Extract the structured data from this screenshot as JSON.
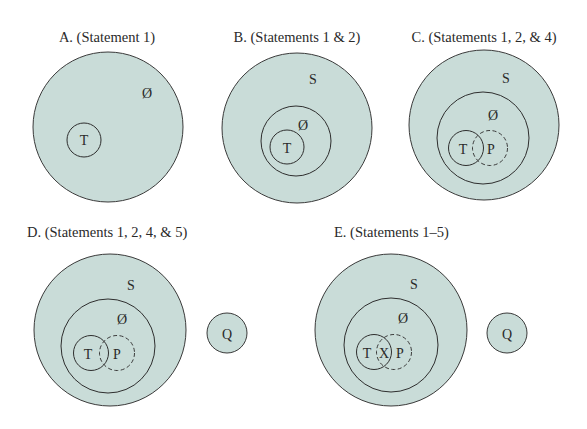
{
  "figure": {
    "colors": {
      "set_fill": "#c9dcd8",
      "stroke": "#2e2e2e",
      "background": "#ffffff"
    },
    "panels": [
      {
        "id": "A",
        "title": "A. (Statement 1)",
        "circles": [
          {
            "label": "",
            "role": "universe",
            "cx": 108,
            "cy": 127,
            "r": 75
          },
          {
            "label": "T",
            "cx": 84,
            "cy": 140,
            "r": 17
          }
        ],
        "labels": [
          {
            "text": "Ø",
            "x": 147,
            "y": 98
          },
          {
            "text": "T",
            "x": 84,
            "y": 145
          }
        ]
      },
      {
        "id": "B",
        "title": "B. (Statements 1 & 2)",
        "circles": [
          {
            "label": "S",
            "role": "universe",
            "cx": 297,
            "cy": 128,
            "r": 75
          },
          {
            "label": "Ø",
            "cx": 296,
            "cy": 141,
            "r": 35
          },
          {
            "label": "T",
            "cx": 287,
            "cy": 147,
            "r": 17
          }
        ],
        "labels": [
          {
            "text": "S",
            "x": 313,
            "y": 84
          },
          {
            "text": "Ø",
            "x": 303,
            "y": 130
          },
          {
            "text": "T",
            "x": 287,
            "y": 153
          }
        ]
      },
      {
        "id": "C",
        "title": "C. (Statements 1, 2, & 4)",
        "circles": [
          {
            "label": "S",
            "role": "universe",
            "cx": 484,
            "cy": 125,
            "r": 75
          },
          {
            "label": "Ø",
            "cx": 483,
            "cy": 138,
            "r": 46
          },
          {
            "label": "T",
            "cx": 466,
            "cy": 148,
            "r": 17.5
          },
          {
            "label": "P",
            "cx": 490,
            "cy": 148,
            "r": 17.5,
            "dashed": true
          }
        ],
        "labels": [
          {
            "text": "S",
            "x": 506,
            "y": 83
          },
          {
            "text": "Ø",
            "x": 493,
            "y": 120
          },
          {
            "text": "T",
            "x": 463,
            "y": 154
          },
          {
            "text": "P",
            "x": 491,
            "y": 154
          }
        ]
      },
      {
        "id": "D",
        "title": "D. (Statements 1, 2, 4, & 5)",
        "circles": [
          {
            "label": "S",
            "role": "universe",
            "cx": 110,
            "cy": 330,
            "r": 76
          },
          {
            "label": "Ø",
            "cx": 108,
            "cy": 346,
            "r": 47
          },
          {
            "label": "T",
            "cx": 91,
            "cy": 353,
            "r": 17.5
          },
          {
            "label": "P",
            "cx": 117,
            "cy": 353,
            "r": 17.5,
            "dashed": true
          },
          {
            "label": "Q",
            "cx": 227,
            "cy": 333,
            "r": 20
          }
        ],
        "labels": [
          {
            "text": "S",
            "x": 131,
            "y": 290
          },
          {
            "text": "Ø",
            "x": 122,
            "y": 324
          },
          {
            "text": "T",
            "x": 88,
            "y": 359
          },
          {
            "text": "P",
            "x": 117,
            "y": 359
          },
          {
            "text": "Q",
            "x": 227,
            "y": 339
          }
        ]
      },
      {
        "id": "E",
        "title": "E. (Statements 1–5)",
        "circles": [
          {
            "label": "S",
            "role": "universe",
            "cx": 391,
            "cy": 330,
            "r": 76
          },
          {
            "label": "Ø",
            "cx": 391,
            "cy": 345,
            "r": 47
          },
          {
            "label": "T",
            "cx": 374,
            "cy": 352,
            "r": 17.5
          },
          {
            "label": "P",
            "cx": 394,
            "cy": 352,
            "r": 17.5,
            "dashed": true
          },
          {
            "label": "Q",
            "cx": 507,
            "cy": 333,
            "r": 20
          }
        ],
        "labels": [
          {
            "text": "S",
            "x": 414,
            "y": 289
          },
          {
            "text": "Ø",
            "x": 403,
            "y": 323
          },
          {
            "text": "T",
            "x": 367,
            "y": 358
          },
          {
            "text": "X",
            "x": 384,
            "y": 358
          },
          {
            "text": "P",
            "x": 400,
            "y": 358
          },
          {
            "text": "Q",
            "x": 507,
            "y": 339
          }
        ]
      }
    ]
  }
}
